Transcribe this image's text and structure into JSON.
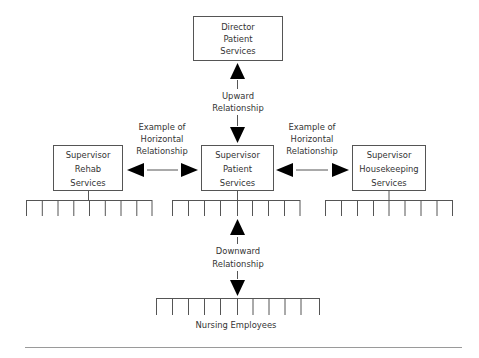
{
  "boxes": {
    "director": {
      "lines": [
        "Director",
        "Patient",
        "Services"
      ]
    },
    "rehab": {
      "lines": [
        "Supervisor",
        "Rehab",
        "Services"
      ]
    },
    "patient": {
      "lines": [
        "Supervisor",
        "Patient",
        "Services"
      ]
    },
    "housekeeping": {
      "lines": [
        "Supervisor",
        "Housekeeping",
        "Services"
      ]
    }
  },
  "relationships": {
    "upward": {
      "lines": [
        "Upward",
        "Relationship"
      ]
    },
    "horizontal_left": {
      "lines": [
        "Example of",
        "Horizontal",
        "Relationship"
      ]
    },
    "horizontal_right": {
      "lines": [
        "Example of",
        "Horizontal",
        "Relationship"
      ]
    },
    "downward": {
      "lines": [
        "Downward",
        "Relationship"
      ]
    }
  },
  "groups": {
    "nursing": {
      "label": "Nursing Employees",
      "member_count": 12
    },
    "rehab_staff": {
      "member_count": 9
    },
    "patient_staff": {
      "member_count": 9
    },
    "housekeeping_staff": {
      "member_count": 9
    }
  },
  "colors": {
    "line": "#555555",
    "arrow": "#000000",
    "text": "#333333",
    "rule": "#9a9a9a"
  }
}
